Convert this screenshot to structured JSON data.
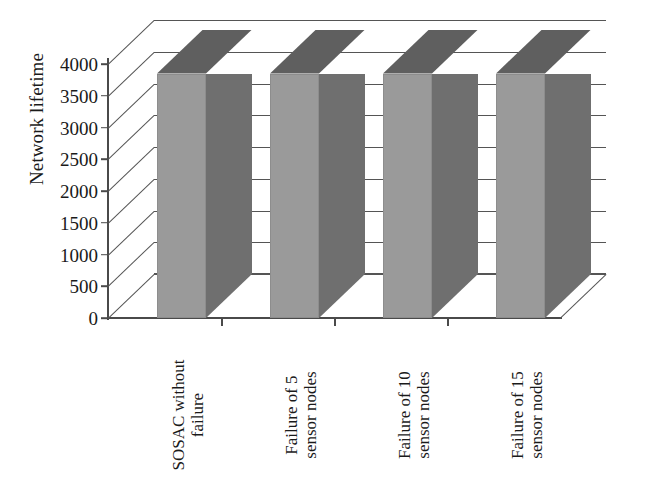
{
  "chart_data": {
    "type": "bar",
    "title": "",
    "subtitle": "",
    "xlabel": "",
    "ylabel": "Network lifetime",
    "ylim": [
      0,
      4000
    ],
    "ytick_step": 500,
    "yticks": [
      0,
      500,
      1000,
      1500,
      2000,
      2500,
      3000,
      3500,
      4000
    ],
    "ytick_labels": [
      "0",
      "500",
      "1000",
      "1500",
      "2000",
      "2500",
      "3000",
      "3500",
      "4000"
    ],
    "categories": [
      "SOSAC without failure",
      "Failure of 5 sensor nodes",
      "Failure of 10 sensor nodes",
      "Failure of 15 sensor nodes"
    ],
    "category_lines": [
      [
        "SOSAC without",
        "failure"
      ],
      [
        "Failure of 5",
        "sensor nodes"
      ],
      [
        "Failure of 10",
        "sensor nodes"
      ],
      [
        "Failure of 15",
        "sensor nodes"
      ]
    ],
    "values": [
      3850,
      3850,
      3850,
      3850
    ],
    "series": [
      {
        "name": "Network lifetime",
        "values": [
          3850,
          3850,
          3850,
          3850
        ]
      }
    ],
    "grid": true,
    "grid_axis": "y",
    "legend": false,
    "legend_position": "none",
    "three_d": true,
    "annotations": []
  },
  "style": {
    "bar_front_color": "#9a9a9a",
    "bar_side_color": "#6f6f6f",
    "bar_top_color": "#5f5f5f",
    "grid_color": "#555555",
    "axis_color": "#4a4a4a",
    "text_color": "#1a1a1a",
    "background": "#ffffff"
  }
}
